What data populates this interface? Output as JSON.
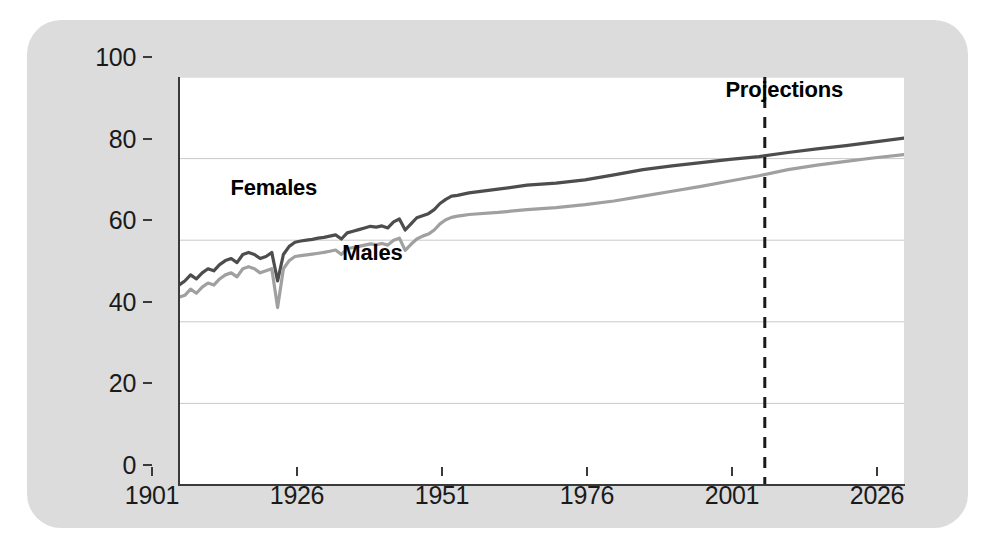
{
  "chart_data": {
    "type": "line",
    "title": "",
    "subtitle": "",
    "xlabel": "",
    "ylabel": "",
    "xlim": [
      1901,
      2026
    ],
    "ylim": [
      0,
      100
    ],
    "grid": true,
    "legend_position": "inline-annotations",
    "xticks": [
      "1901",
      "1926",
      "1951",
      "1976",
      "2001",
      "2026"
    ],
    "xtick_values": [
      1901,
      1926,
      1951,
      1976,
      2001,
      2026
    ],
    "yticks": [
      "0",
      "20",
      "40",
      "60",
      "80",
      "100"
    ],
    "ytick_values": [
      0,
      20,
      40,
      60,
      80,
      100
    ],
    "annotations": [
      {
        "text": "Females",
        "x": 1922,
        "y": 68,
        "style": "bold"
      },
      {
        "text": "Males",
        "x": 1939,
        "y": 52,
        "style": "bold"
      },
      {
        "text": "Projections",
        "x": 2010,
        "y": 92,
        "style": "bold"
      }
    ],
    "reference_lines": [
      {
        "name": "projection-start",
        "x": 2002,
        "style": "dashed",
        "color": "#1a1a1a"
      }
    ],
    "series": [
      {
        "name": "Females",
        "color": "#4d4d4d",
        "x": [
          1901,
          1902,
          1903,
          1904,
          1905,
          1906,
          1907,
          1908,
          1909,
          1910,
          1911,
          1912,
          1913,
          1914,
          1915,
          1916,
          1917,
          1918,
          1919,
          1920,
          1921,
          1922,
          1923,
          1924,
          1925,
          1926,
          1927,
          1928,
          1929,
          1930,
          1931,
          1932,
          1933,
          1934,
          1935,
          1936,
          1937,
          1938,
          1939,
          1940,
          1941,
          1942,
          1943,
          1944,
          1945,
          1946,
          1947,
          1948,
          1949,
          1950,
          1951,
          1956,
          1961,
          1966,
          1971,
          1976,
          1981,
          1986,
          1991,
          1996,
          2001,
          2006,
          2011,
          2016,
          2021,
          2026
        ],
        "values": [
          49.0,
          50.0,
          51.5,
          50.5,
          52.0,
          53.0,
          52.5,
          54.0,
          55.0,
          55.5,
          54.5,
          56.5,
          57.0,
          56.5,
          55.5,
          56.0,
          57.0,
          50.0,
          56.5,
          58.5,
          59.5,
          59.8,
          60.0,
          60.2,
          60.5,
          60.7,
          61.0,
          61.3,
          60.3,
          61.8,
          62.2,
          62.6,
          63.0,
          63.4,
          63.2,
          63.5,
          63.0,
          64.5,
          65.2,
          62.5,
          64.0,
          65.5,
          66.0,
          66.5,
          67.5,
          69.0,
          70.0,
          70.8,
          71.0,
          71.3,
          71.6,
          72.5,
          73.5,
          74.0,
          74.8,
          76.0,
          77.3,
          78.2,
          79.0,
          79.8,
          80.5,
          81.5,
          82.4,
          83.2,
          84.1,
          85.0
        ]
      },
      {
        "name": "Males",
        "color": "#a0a0a0",
        "x": [
          1901,
          1902,
          1903,
          1904,
          1905,
          1906,
          1907,
          1908,
          1909,
          1910,
          1911,
          1912,
          1913,
          1914,
          1915,
          1916,
          1917,
          1918,
          1919,
          1920,
          1921,
          1922,
          1923,
          1924,
          1925,
          1926,
          1927,
          1928,
          1929,
          1930,
          1931,
          1932,
          1933,
          1934,
          1935,
          1936,
          1937,
          1938,
          1939,
          1940,
          1941,
          1942,
          1943,
          1944,
          1945,
          1946,
          1947,
          1948,
          1949,
          1950,
          1951,
          1956,
          1961,
          1966,
          1971,
          1976,
          1981,
          1986,
          1991,
          1996,
          2001,
          2006,
          2011,
          2016,
          2021,
          2026
        ],
        "values": [
          46.0,
          46.5,
          48.0,
          47.0,
          48.5,
          49.5,
          49.0,
          50.5,
          51.5,
          52.0,
          51.0,
          53.0,
          53.5,
          53.0,
          52.0,
          52.5,
          53.0,
          43.5,
          53.0,
          55.0,
          56.0,
          56.2,
          56.4,
          56.6,
          56.8,
          57.0,
          57.3,
          57.6,
          56.5,
          57.9,
          58.2,
          58.5,
          58.8,
          59.1,
          58.9,
          59.2,
          58.8,
          60.0,
          60.5,
          57.5,
          59.0,
          60.3,
          61.0,
          61.5,
          62.5,
          64.0,
          65.0,
          65.6,
          65.9,
          66.1,
          66.3,
          66.8,
          67.5,
          68.0,
          68.7,
          69.6,
          70.8,
          72.0,
          73.2,
          74.5,
          75.8,
          77.3,
          78.4,
          79.3,
          80.2,
          81.0
        ]
      }
    ]
  },
  "panel": {
    "background_color": "#dcdcdc",
    "plot_background_color": "#ffffff"
  }
}
